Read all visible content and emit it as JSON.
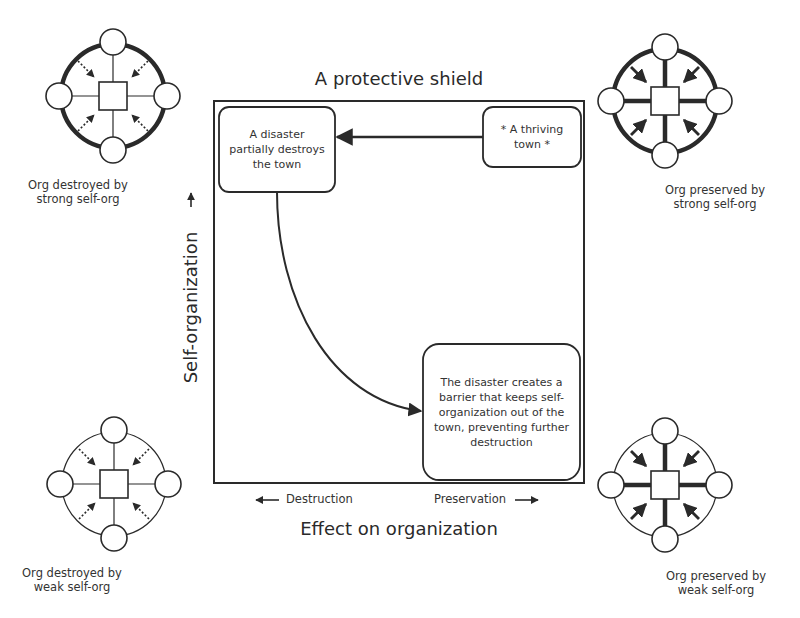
{
  "diagram": {
    "title": "A protective shield",
    "x_axis_title": "Effect on organization",
    "x_axis_left": "Destruction",
    "x_axis_right": "Preservation",
    "y_axis_title": "Self-organization",
    "boxes": {
      "thriving": "* A thriving town *",
      "disaster": "A disaster partially destroys the town",
      "barrier": "The disaster creates a barrier that keeps self-organization out of the town, preventing further destruction"
    },
    "corners": {
      "top_left": {
        "line1": "Org destroyed by",
        "line2": "strong self-org"
      },
      "top_right": {
        "line1": "Org preserved by",
        "line2": "strong self-org"
      },
      "bottom_left": {
        "line1": "Org destroyed by",
        "line2": "weak self-org"
      },
      "bottom_right": {
        "line1": "Org preserved by",
        "line2": "weak self-org"
      }
    },
    "colors": {
      "stroke": "#2a2a2a",
      "background": "#ffffff"
    }
  }
}
